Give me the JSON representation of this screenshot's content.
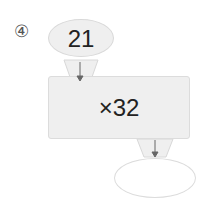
{
  "problem_label": "④",
  "input_value": "21",
  "operation": "×32",
  "output_value": "",
  "colors": {
    "fill": "#efefef",
    "border": "#d8d8d8",
    "arrow": "#666666"
  }
}
